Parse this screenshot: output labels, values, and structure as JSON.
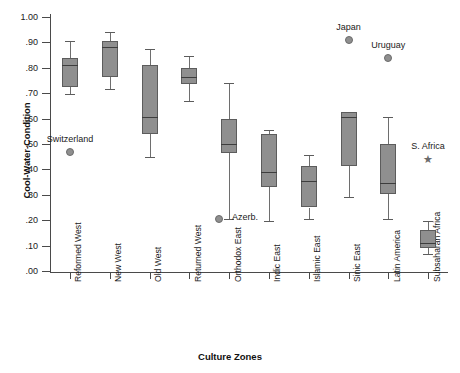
{
  "chart_data": {
    "type": "box",
    "title": "",
    "xlabel": "Culture Zones",
    "ylabel": "Cool-Water-Condition",
    "ylim": [
      0.0,
      1.0
    ],
    "grid": false,
    "legend": "none",
    "ytick_labels": [
      "1.00",
      ".90",
      ".80",
      ".70",
      ".60",
      ".50",
      ".40",
      ".30",
      ".20",
      ".10",
      ".00"
    ],
    "ytick_values": [
      1.0,
      0.9,
      0.8,
      0.7,
      0.6,
      0.5,
      0.4,
      0.3,
      0.2,
      0.1,
      0.0
    ],
    "categories": [
      "Reformed West",
      "New West",
      "Old West",
      "Returned West",
      "Orthodox East",
      "Indic East",
      "Islamic East",
      "Sinic East",
      "Latin America",
      "Subsaharan Africa"
    ],
    "boxes": [
      {
        "category": "Reformed West",
        "whisker_low": 0.695,
        "q1": 0.725,
        "median": 0.81,
        "q3": 0.84,
        "whisker_high": 0.905
      },
      {
        "category": "New West",
        "whisker_low": 0.715,
        "q1": 0.765,
        "median": 0.88,
        "q3": 0.905,
        "whisker_high": 0.94
      },
      {
        "category": "Old West",
        "whisker_low": 0.45,
        "q1": 0.54,
        "median": 0.605,
        "q3": 0.81,
        "whisker_high": 0.875
      },
      {
        "category": "Returned West",
        "whisker_low": 0.67,
        "q1": 0.735,
        "median": 0.765,
        "q3": 0.8,
        "whisker_high": 0.845
      },
      {
        "category": "Orthodox East",
        "whisker_low": 0.205,
        "q1": 0.465,
        "median": 0.5,
        "q3": 0.6,
        "whisker_high": 0.74
      },
      {
        "category": "Indic East",
        "whisker_low": 0.195,
        "q1": 0.33,
        "median": 0.39,
        "q3": 0.54,
        "whisker_high": 0.555
      },
      {
        "category": "Islamic East",
        "whisker_low": 0.205,
        "q1": 0.25,
        "median": 0.355,
        "q3": 0.415,
        "whisker_high": 0.455
      },
      {
        "category": "Sinic East",
        "whisker_low": 0.29,
        "q1": 0.415,
        "median": 0.605,
        "q3": 0.625,
        "whisker_high": 0.625
      },
      {
        "category": "Latin America",
        "whisker_low": 0.205,
        "q1": 0.305,
        "median": 0.345,
        "q3": 0.5,
        "whisker_high": 0.605
      },
      {
        "category": "Subsaharan Africa",
        "whisker_low": 0.065,
        "q1": 0.09,
        "median": 0.11,
        "q3": 0.16,
        "whisker_high": 0.195
      }
    ],
    "annotations": [
      {
        "label": "Switzerland",
        "category": "Reformed West",
        "value": 0.47,
        "marker": "dot",
        "label_position": "above"
      },
      {
        "label": "Azerb.",
        "category": "Orthodox East",
        "value": 0.205,
        "marker": "dot",
        "label_position": "right"
      },
      {
        "label": "Japan",
        "category": "Sinic East",
        "value": 0.91,
        "marker": "dot",
        "label_position": "above"
      },
      {
        "label": "Uruguay",
        "category": "Latin America",
        "value": 0.84,
        "marker": "dot",
        "label_position": "above"
      },
      {
        "label": "S. Africa",
        "category": "Subsaharan Africa",
        "value": 0.44,
        "marker": "star",
        "label_position": "above"
      }
    ],
    "colors": {
      "box_fill": "#8f8f8f",
      "box_stroke": "#5c5c5c",
      "median": "#3d3d3d",
      "whisker": "#6e6e6e",
      "axis": "#4a4a4a",
      "text": "#1a1a1a",
      "background": "#ffffff"
    }
  }
}
